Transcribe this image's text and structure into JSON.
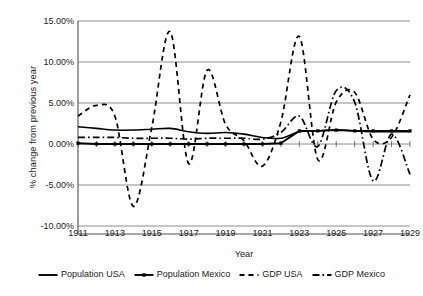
{
  "chart_data": {
    "type": "line",
    "title": "",
    "xlabel": "Year",
    "ylabel": "% change from previous year",
    "xlim": [
      1911,
      1929
    ],
    "ylim": [
      -10,
      15
    ],
    "grid": true,
    "legend_position": "bottom",
    "y_tick_labels": [
      "15.00%",
      "10.00%",
      "5.00%",
      "0.00%",
      "-5.00%",
      "-10.00%"
    ],
    "y_tick_values": [
      15,
      10,
      5,
      0,
      -5,
      -10
    ],
    "x_tick_labels": [
      "1911",
      "1913",
      "1915",
      "1917",
      "1919",
      "1921",
      "1923",
      "1925",
      "1927",
      "1929"
    ],
    "x_tick_values": [
      1911,
      1913,
      1915,
      1917,
      1919,
      1921,
      1923,
      1925,
      1927,
      1929
    ],
    "x": [
      1911,
      1912,
      1913,
      1914,
      1915,
      1916,
      1917,
      1918,
      1919,
      1920,
      1921,
      1922,
      1923,
      1924,
      1925,
      1926,
      1927,
      1928,
      1929
    ],
    "series": [
      {
        "name": "Population USA",
        "style": "solid",
        "color": "#000000",
        "values": [
          2.1,
          1.9,
          1.7,
          1.7,
          1.8,
          1.9,
          1.5,
          1.3,
          1.4,
          1.2,
          0.8,
          0.7,
          1.5,
          1.6,
          1.7,
          1.6,
          1.5,
          1.5,
          1.5
        ]
      },
      {
        "name": "Population Mexico",
        "style": "solid-markers",
        "color": "#000000",
        "values": [
          0.1,
          0.0,
          0.0,
          0.0,
          0.0,
          0.0,
          0.0,
          0.0,
          0.0,
          0.0,
          0.0,
          0.1,
          1.6,
          1.6,
          1.7,
          1.6,
          1.6,
          1.6,
          1.6
        ]
      },
      {
        "name": "GDP USA",
        "style": "dashed",
        "color": "#000000",
        "values": [
          3.4,
          4.7,
          3.4,
          -7.6,
          2.0,
          13.7,
          -2.4,
          9.0,
          2.4,
          0.4,
          -2.7,
          2.7,
          13.1,
          -1.9,
          5.1,
          6.3,
          0.6,
          0.8,
          6.0
        ]
      },
      {
        "name": "GDP Mexico",
        "style": "dash-dot",
        "color": "#000000",
        "values": [
          0.8,
          0.8,
          0.8,
          0.7,
          0.7,
          0.7,
          0.6,
          0.7,
          0.7,
          0.7,
          0.6,
          1.4,
          3.4,
          -0.3,
          6.5,
          5.1,
          -4.5,
          1.2,
          -3.7
        ]
      }
    ]
  },
  "axes": {
    "y_title": "% change from previous year",
    "x_title": "Year"
  },
  "legend": {
    "items": [
      {
        "label": "Population USA",
        "icon": "solid-line-icon"
      },
      {
        "label": "Population Mexico",
        "icon": "solid-line-marker-icon"
      },
      {
        "label": "GDP USA",
        "icon": "dashed-line-icon"
      },
      {
        "label": "GDP Mexico",
        "icon": "dash-dot-line-icon"
      }
    ]
  },
  "colors": {
    "line": "#000000",
    "grid": "#808080",
    "axis": "#4d4d4d",
    "text": "#1a1a1a",
    "background": "#ffffff"
  }
}
